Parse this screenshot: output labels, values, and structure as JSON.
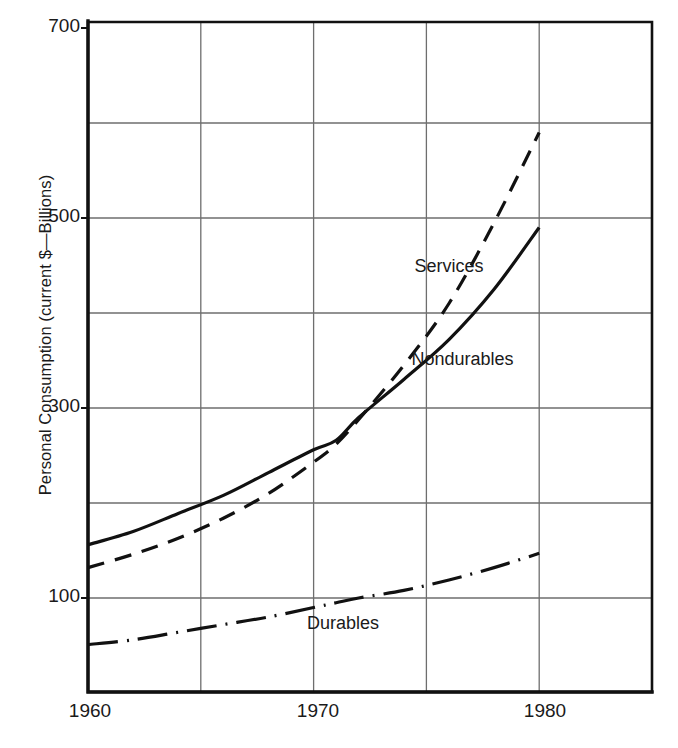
{
  "chart_data": {
    "type": "line",
    "title": "",
    "xlabel": "",
    "ylabel": "Personal Consumption (current $—Billions)",
    "xlim": [
      1960,
      1985
    ],
    "ylim": [
      0,
      700
    ],
    "x_ticks": [
      1960,
      1970,
      1980
    ],
    "x_tick_labels": [
      "1960",
      "1970",
      "1980"
    ],
    "x_gridlines": [
      1965,
      1970,
      1975,
      1980
    ],
    "y_ticks": [
      100,
      300,
      500,
      700
    ],
    "y_tick_labels": [
      "100",
      "300",
      "500",
      "700"
    ],
    "y_gridlines": [
      100,
      200,
      300,
      400,
      500,
      600
    ],
    "grid": true,
    "legend_position": "inline-annotations",
    "x": [
      1960,
      1962,
      1964,
      1966,
      1968,
      1970,
      1971,
      1972,
      1974,
      1976,
      1978,
      1980
    ],
    "series": [
      {
        "name": "Services",
        "label": "Services",
        "linestyle": "dashed",
        "values": [
          132,
          146,
          163,
          184,
          210,
          243,
          262,
          288,
          345,
          410,
          495,
          590
        ]
      },
      {
        "name": "Nondurables",
        "label": "Nondurables",
        "linestyle": "solid",
        "values": [
          156,
          170,
          189,
          208,
          232,
          256,
          266,
          290,
          330,
          372,
          425,
          490
        ]
      },
      {
        "name": "Durables",
        "label": "Durables",
        "linestyle": "dash-dot",
        "values": [
          51,
          56,
          64,
          72,
          80,
          90,
          95,
          100,
          108,
          119,
          132,
          147
        ]
      }
    ],
    "annotations": [
      {
        "text": "Services",
        "x": 1976.0,
        "y": 448
      },
      {
        "text": "Nondurables",
        "x": 1976.6,
        "y": 350
      },
      {
        "text": "Durables",
        "x": 1971.3,
        "y": 72
      }
    ]
  },
  "style": {
    "line_color": "#111111",
    "grid_color": "#6e6e6e",
    "axis_color": "#111111",
    "background": "#ffffff"
  }
}
